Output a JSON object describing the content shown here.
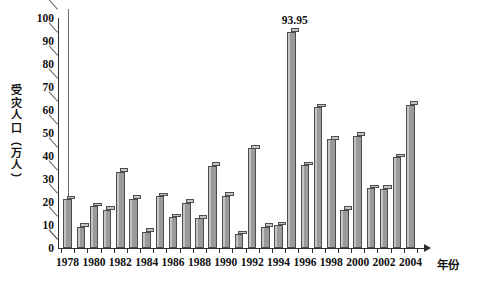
{
  "chart_data": {
    "type": "bar",
    "title": "",
    "xlabel": "年份",
    "ylabel": "受灾人口（万人）",
    "ylabel_chars": [
      "受",
      "灾",
      "人",
      "口",
      "（",
      "万",
      "人",
      "）"
    ],
    "ylim": [
      0,
      100
    ],
    "ytick_labels": [
      "0",
      "10",
      "20",
      "30",
      "40",
      "50",
      "60",
      "70",
      "80",
      "90",
      "100"
    ],
    "ytick_values": [
      0,
      10,
      20,
      30,
      40,
      50,
      60,
      70,
      80,
      90,
      100
    ],
    "grid": true,
    "legend": "none",
    "categories": [
      "1978",
      "1979",
      "1980",
      "1981",
      "1982",
      "1983",
      "1984",
      "1985",
      "1986",
      "1987",
      "1988",
      "1989",
      "1990",
      "1991",
      "1992",
      "1993",
      "1994",
      "1995",
      "1996",
      "1997",
      "1998",
      "1999",
      "2000",
      "2001",
      "2002",
      "2003",
      "2004"
    ],
    "xtick_labels": [
      "1978",
      "1980",
      "1982",
      "1984",
      "1986",
      "1988",
      "1990",
      "1992",
      "1994",
      "1996",
      "1998",
      "2000",
      "2002",
      "2004"
    ],
    "values": [
      21.3,
      9.2,
      18.2,
      16.7,
      33.2,
      21.4,
      7.0,
      22.5,
      13.4,
      19.7,
      12.9,
      35.8,
      22.7,
      6.0,
      43.3,
      9.2,
      9.9,
      93.95,
      36.1,
      61.3,
      47.2,
      16.7,
      48.8,
      26.1,
      25.8,
      39.5,
      62.3
    ],
    "data_labels": [
      {
        "category": "1995",
        "value": 93.95,
        "text": "93.95"
      }
    ],
    "colors": {
      "bar_fill": "#9a9a9a",
      "bar_border": "#4d4d4d",
      "bar_highlight": "#c4c4c4",
      "gridline": "#3a3a3a",
      "axis": "#2e2e2e",
      "text": "#111111",
      "background": "#ffffff"
    }
  }
}
